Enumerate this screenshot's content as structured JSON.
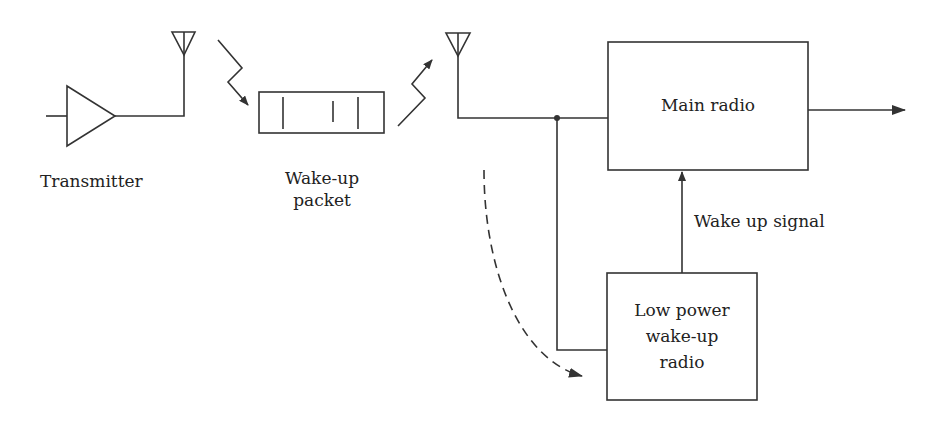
{
  "diagram": {
    "type": "block-diagram",
    "title": "",
    "colors": {
      "line": "#333333",
      "background": "#ffffff",
      "text": "#222222"
    },
    "nodes": {
      "transmitter": {
        "label": "Transmitter",
        "shape": "amplifier-triangle"
      },
      "wakeup_packet": {
        "label_line1": "Wake-up",
        "label_line2": "packet",
        "shape": "packet-rectangle"
      },
      "main_radio": {
        "label": "Main radio",
        "shape": "rectangle"
      },
      "low_power_radio": {
        "label_line1": "Low power",
        "label_line2": "wake-up",
        "label_line3": "radio",
        "shape": "rectangle"
      },
      "tx_antenna": {
        "shape": "antenna-icon"
      },
      "rx_antenna": {
        "shape": "antenna-icon"
      }
    },
    "edges": {
      "wakeup_signal": {
        "label": "Wake up signal",
        "from": "low_power_radio",
        "to": "main_radio"
      },
      "main_output": {
        "from": "main_radio",
        "to": "output"
      },
      "rx_to_main": {
        "from": "rx_antenna",
        "to": "main_radio"
      },
      "rx_to_lowpower": {
        "from": "rx_antenna",
        "to": "low_power_radio"
      },
      "dashed_flow": {
        "from": "rx_antenna",
        "to": "low_power_radio",
        "style": "dashed"
      }
    }
  }
}
